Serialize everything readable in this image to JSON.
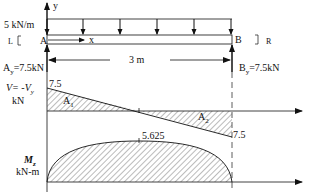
{
  "beam": {
    "load_label": "5 kN/m",
    "left_support_label": "L",
    "right_support_label": "R",
    "point_a": "A",
    "point_b": "B",
    "y_axis": "y",
    "x_axis": "x",
    "span_label": "3 m",
    "reaction_a": "A",
    "reaction_a_sub": "y",
    "reaction_a_value": "=7.5kN",
    "reaction_b": "B",
    "reaction_b_sub": "y",
    "reaction_b_value": "=7.5kN"
  },
  "shear": {
    "axis_label_line1": "V= -V",
    "axis_label_sub": "y",
    "axis_label_line2": "kN",
    "value_start": "7.5",
    "value_end": "7.5",
    "area1": "A",
    "area1_sub": "1",
    "area2": "A",
    "area2_sub": "2"
  },
  "moment": {
    "axis_label_line1": "M",
    "axis_label_sub": "z",
    "axis_label_line2": "kN-m",
    "peak_value": "5.625"
  },
  "colors": {
    "line": "#111111",
    "hatch": "#555555",
    "dash": "#333333"
  }
}
